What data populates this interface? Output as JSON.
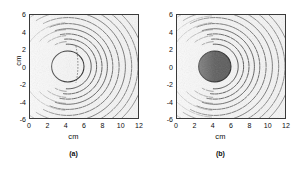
{
  "figure": {
    "background_color": "#ffffff",
    "panel_background_color": "#f4f4f4",
    "frame_color": "#3a3a3a",
    "contour_color": "#1a1a1a",
    "inclusion_fill_color": "#4a4a4a",
    "inclusion_outline_color": "#111111"
  },
  "panels": [
    {
      "caption": "(a)",
      "xlabel": "cm",
      "ylabel": "cm",
      "inclusion_filled": false
    },
    {
      "caption": "(b)",
      "xlabel": "cm",
      "ylabel": "",
      "inclusion_filled": true
    }
  ],
  "chart_data": [
    {
      "type": "line",
      "title": "(a)",
      "xlabel": "cm",
      "ylabel": "cm",
      "xlim": [
        0,
        12
      ],
      "ylim": [
        -6,
        6
      ],
      "xticks": [
        0,
        2,
        4,
        6,
        8,
        10,
        12
      ],
      "yticks": [
        6,
        4,
        2,
        0,
        -2,
        -4,
        -6
      ],
      "xticklabels": [
        "0",
        "2",
        "4",
        "6",
        "8",
        "10",
        "12"
      ],
      "yticklabels": [
        "6",
        "4",
        "2",
        "0",
        "-2",
        "-4",
        "-6"
      ],
      "grid": false,
      "legend": null,
      "annotations": [
        {
          "name": "circular-inclusion",
          "shape": "circle",
          "center": [
            4.2,
            0.0
          ],
          "radius": 1.8,
          "filled": false,
          "edge_style": "solid"
        },
        {
          "name": "interior-dotted-arc",
          "shape": "arc",
          "style": "dotted",
          "x": 5.1,
          "y_range": [
            -1.9,
            2.4
          ]
        }
      ],
      "contours": {
        "description": "Wavefront arcs curving around and to the right of the circular inclusion; arcs open leftward, centered near the inclusion.",
        "source_x": 4.2,
        "source_y": 0.0,
        "arc_radii": [
          2.6,
          3.2,
          3.8,
          4.4,
          5.0,
          5.7,
          6.4,
          7.1,
          7.8,
          8.5
        ],
        "faint_left_arc_radii": [
          2.9,
          3.6,
          4.3,
          5.1
        ],
        "count": 10
      }
    },
    {
      "type": "line",
      "title": "(b)",
      "xlabel": "cm",
      "ylabel": "",
      "xlim": [
        0,
        12
      ],
      "ylim": [
        -6,
        6
      ],
      "xticks": [
        0,
        2,
        4,
        6,
        8,
        10,
        12
      ],
      "yticks": [
        6,
        4,
        2,
        0,
        -2,
        -4,
        -6
      ],
      "xticklabels": [
        "0",
        "2",
        "4",
        "6",
        "8",
        "10",
        "12"
      ],
      "yticklabels": [
        "6",
        "4",
        "2",
        "0",
        "-2",
        "-4",
        "-6"
      ],
      "grid": false,
      "legend": null,
      "annotations": [
        {
          "name": "circular-inclusion",
          "shape": "circle",
          "center": [
            4.2,
            0.0
          ],
          "radius": 1.8,
          "filled": true,
          "fill": "#4a4a4a",
          "edge_style": "solid"
        }
      ],
      "contours": {
        "description": "Wavefront arcs curving around and to the right of the filled circular inclusion, with additional arcs sweeping into the upper-left and lower-left regions.",
        "source_x": 4.2,
        "source_y": 0.0,
        "arc_radii": [
          2.6,
          3.2,
          3.8,
          4.4,
          5.0,
          5.7,
          6.4,
          7.1,
          7.8,
          8.5
        ],
        "faint_left_arc_radii": [
          2.9,
          3.6,
          4.3,
          5.1,
          5.9
        ],
        "count": 10
      }
    }
  ]
}
